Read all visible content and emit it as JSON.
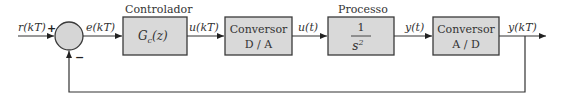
{
  "diagram": {
    "type": "block-diagram",
    "blocks": [
      {
        "id": "controller",
        "caption": "Controlador",
        "line1": "G",
        "sub": "c",
        "line1_suffix": "(z)"
      },
      {
        "id": "dac",
        "caption": "",
        "line1": "Conversor",
        "line2": "D / A"
      },
      {
        "id": "plant",
        "caption": "Processo",
        "numerator": "1",
        "denominator": "s",
        "den_exp": "2"
      },
      {
        "id": "adc",
        "caption": "",
        "line1": "Conversor",
        "line2": "A / D"
      }
    ],
    "summing_junction": {
      "plus_sign": "+",
      "minus_sign": "−"
    },
    "signals": {
      "input": "r(kT)",
      "error": "e(kT)",
      "control_discrete": "u(kT)",
      "control_continuous": "u(t)",
      "output_continuous": "y(t)",
      "output_discrete": "y(kT)"
    },
    "colors": {
      "block_fill": "#d9d9d9",
      "stroke": "#333333"
    }
  }
}
